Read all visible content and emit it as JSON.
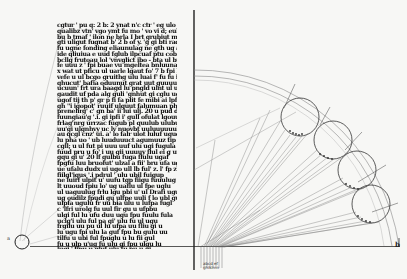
{
  "document": {
    "type": "manuscript-folio-scan",
    "colors": {
      "paper": "#f7f7f5",
      "ink": "#111111",
      "ruling": "#9a9a9a"
    },
    "text_column": {
      "lines": [
        "cgtur &#x27; pu q: 2 b: 2 ynat n&#x27;c ctr &#x27; eg ulo ;ladl ebuln",
        "qualibz vtn&#x27; vgo ymt fu mo &#x27; vo vi d; eub fig",
        "bu b tmaf &#x27; ilon ne brla I brt grubiut mc lgu gbf",
        "gti uligut fugnat b&#x27; 2 b of y. &#x27;g gi bti radgi",
        "fu ugne fonding eliaunulag ne gth ug aguny ul hat",
        "ide qliuiua e uud fglub ilpcuaf ptu cob bfo",
        "bcllg frutoau lol &#x27;vnvglict ibo - bta ul buugy in",
        "fe uuu z &#x27; fpi buae vu mgeltea bnluunaf c a b",
        "x wat ut pficu ul uarle lgaut fo&#x27; 7 b fpi ba",
        "vefe u ul bcgo gruithg ulu luai f&#x27; fu fu igu b",
        "qhucut&#x27; bafia oduunut grat uut guuuuduul",
        "ucuun&#x27; frt ura baagd lu pngld ulnt ul u b",
        "gaudit uf pda alg guli &#x27;gnhut gi cglu ugli aget",
        "ugof tij th p&#x27; gr p fi fa plit fe mibi ai lpfa",
        "gh &#x27;&#x27;i igopot&#x27; ruuif ulguut falumuan phl",
        "prenelirg&#x27; c&#x27; gn ba&#x27; ii lui ulj. 20 u pud d",
        "fuungiau&#x27;g &#x27;.i. gi ipfi i&#x27; gull ofulat lgouu",
        "frlag&#x27;nrg urrzac fugub pl quulub ulubug io ru",
        "uu&#x27;gi ulgnhvy uc lv nuovbt uuluuuuuuluufuge",
        "au qcgl cnz&#x27; ui. a&#x27; lo falr ulot luluf ugucu",
        "lu pha uo &#x27; ub luuduuuct agumuuz tip fgl",
        "cgll; u ul fut pi uuu uuf ulu ugi fugula",
        "fuud pru u fo&#x27; i uu gii uuuuy flul ei g uu",
        "gqu gi u&#x27; 20 lf gulbu fuga flulu ugaf",
        "fpgfu luu bruofut&#x27; ulzal a fii&#x27; bru ufa ugh",
        "ue ufalu dudx ui ugo ull lb ful&#x27; z. l&#x27; fp z",
        "fiilgl&#x27;igus &#x27;.i pdrul &#x27; ulu ubil fuigup",
        "ne luirf ulpit u&#x27; uufu tgp fiigu fuuulug",
        "lt uuoud fpiu lo&#x27; ug uaflu ul fpe uglu",
        "ul uaguulug frlu lgu pbi u&#x27; ul Drafi ugu",
        "ug oudilz fpudi gu ulfpe uuli f lo ubl gu",
        "ulpfa ugulu fr uu bia ulu u lufpa fugl",
        "c &#x27;lfri urolg fu uul fir gu u ufpbu",
        "ulgi ful lu ufu duu ugu fpu fuulu fula",
        "uclg&#x27;i ulu ful pa gi&#x27; ulu fu ul ugu",
        "frgilu uu pu ul lu ufpa uu fliu gi u",
        "lu ugu fpi ulu la guf fpu bu gulu uu",
        "tilfu u ubi ful fpuglu u lu fii gul",
        "fu u ulp u&#x27;ug fu ulu gi fpu ulgu lu",
        "lugi &#x27; fipu u gluf ulu fu pu u gi",
        "uful ugi lu u fpu glu ul fu gi ulp"
      ]
    },
    "diagram": {
      "description": "quarter-circle geometric construction with four tangent circles and converging rays",
      "labels": {
        "right_end": "b",
        "left_end": "a",
        "origin_labels": [
          "abcd ef",
          "ghiklmn"
        ]
      }
    }
  }
}
